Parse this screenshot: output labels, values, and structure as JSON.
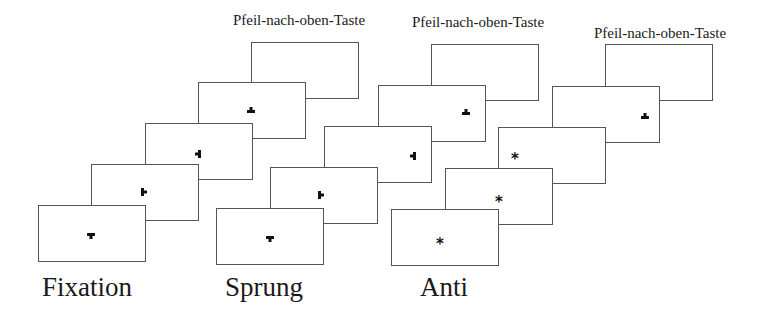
{
  "diagram": {
    "groups": [
      {
        "id": "fixation",
        "label": "Fixation",
        "label_pos": [
          42,
          274
        ],
        "key_label": "Pfeil-nach-oben-Taste",
        "key_label_center": [
          299,
          21
        ],
        "screens": [
          {
            "x": 38,
            "y": 205,
            "symbol": "T-down",
            "sx": 91,
            "sy": 234
          },
          {
            "x": 91,
            "y": 164,
            "symbol": "T-right",
            "sx": 144,
            "sy": 190
          },
          {
            "x": 145,
            "y": 123,
            "symbol": "T-left",
            "sx": 198,
            "sy": 152
          },
          {
            "x": 198,
            "y": 82,
            "symbol": "T-up",
            "sx": 251,
            "sy": 108
          },
          {
            "x": 251,
            "y": 42,
            "symbol": "none"
          }
        ]
      },
      {
        "id": "sprung",
        "label": "Sprung",
        "label_pos": [
          225,
          274
        ],
        "key_label": "Pfeil-nach-oben-Taste",
        "key_label_center": [
          478,
          23
        ],
        "screens": [
          {
            "x": 216,
            "y": 208,
            "symbol": "T-down",
            "sx": 270,
            "sy": 237
          },
          {
            "x": 270,
            "y": 167,
            "symbol": "T-right",
            "sx": 321,
            "sy": 193
          },
          {
            "x": 324,
            "y": 126,
            "symbol": "T-left",
            "sx": 413,
            "sy": 154
          },
          {
            "x": 378,
            "y": 85,
            "symbol": "T-up",
            "sx": 466,
            "sy": 110
          },
          {
            "x": 431,
            "y": 44,
            "symbol": "none"
          }
        ]
      },
      {
        "id": "anti",
        "label": "Anti",
        "label_pos": [
          420,
          274
        ],
        "key_label": "Pfeil-nach-oben-Taste",
        "key_label_center": [
          660,
          34
        ],
        "screens": [
          {
            "x": 391,
            "y": 209,
            "symbol": "star",
            "sx": 440,
            "sy": 241
          },
          {
            "x": 445,
            "y": 168,
            "symbol": "star",
            "sx": 499,
            "sy": 199
          },
          {
            "x": 498,
            "y": 127,
            "symbol": "star",
            "sx": 515,
            "sy": 156
          },
          {
            "x": 552,
            "y": 86,
            "symbol": "T-up",
            "sx": 645,
            "sy": 114
          },
          {
            "x": 605,
            "y": 44,
            "symbol": "none"
          }
        ]
      }
    ],
    "symbol_legend": {
      "T-down": "T-shaped fixation mark pointing down",
      "T-right": "T-shaped mark pointing right",
      "T-left": "T-shaped mark pointing left",
      "T-up": "T-shaped mark pointing up",
      "star": "asterisk stimulus"
    },
    "star_glyph": "*",
    "colors": {
      "border": "#555555",
      "symbol": "#111111",
      "text": "#1a1a1a"
    }
  }
}
